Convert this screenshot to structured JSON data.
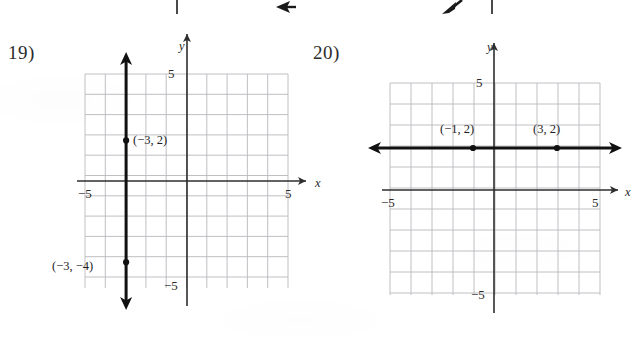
{
  "page": {
    "width": 635,
    "height": 337,
    "background": "#ffffff",
    "ink_color": "#1a1a1a",
    "grid_color": "#b9b9bd",
    "axis_color": "#2e2e2e"
  },
  "top_fragments": [
    {
      "name": "tick-fragment-left",
      "kind": "vertical-tick",
      "x": 176,
      "y": 0,
      "height": 14
    },
    {
      "name": "arrowhead-fragment-left",
      "kind": "arrowhead-left",
      "x": 274,
      "y": 0
    },
    {
      "name": "arrowhead-fragment-right",
      "kind": "arrowhead-diagonal",
      "x": 440,
      "y": 0
    },
    {
      "name": "tick-fragment-right",
      "kind": "vertical-tick",
      "x": 491,
      "y": 0,
      "height": 14
    }
  ],
  "problems": [
    {
      "number": "19)",
      "number_pos": {
        "x": 8,
        "y": 42
      },
      "graph": {
        "origin": {
          "x": 187,
          "y": 181
        },
        "cell": 20.3,
        "grid_box": {
          "left": 85,
          "top": 74,
          "right": 288,
          "bottom": 288
        },
        "x_axis_label": "x",
        "y_axis_label": "y",
        "x_axis_label_pos": {
          "x": 315,
          "y": 176
        },
        "y_axis_label_pos": {
          "x": 179,
          "y": 39
        },
        "ticks": [
          {
            "text": "5",
            "axis": "y",
            "value": 5,
            "pos": {
              "x": 168,
              "y": 66
            }
          },
          {
            "text": "−5",
            "axis": "y",
            "value": -5,
            "pos": {
              "x": 164,
              "y": 278
            }
          },
          {
            "text": "5",
            "axis": "x",
            "value": 5,
            "pos": {
              "x": 285,
              "y": 186
            }
          },
          {
            "text": "−5",
            "axis": "x",
            "value": -5,
            "pos": {
              "x": 78,
              "y": 186
            }
          }
        ],
        "line": {
          "type": "vertical",
          "equation_x": -3,
          "description": "vertical line through x = -3"
        },
        "points": [
          {
            "label": "(−3, 2)",
            "x": -3,
            "y": 2,
            "label_pos": {
              "x": 133,
              "y": 133
            }
          },
          {
            "label": "(−3, −4)",
            "x": -3,
            "y": -4,
            "label_pos": {
              "x": 52,
              "y": 259
            }
          }
        ]
      }
    },
    {
      "number": "20)",
      "number_pos": {
        "x": 313,
        "y": 42
      },
      "graph": {
        "origin": {
          "x": 494,
          "y": 190
        },
        "cell": 21.0,
        "grid_box": {
          "left": 390,
          "top": 83,
          "right": 600,
          "bottom": 295
        },
        "x_axis_label": "x",
        "y_axis_label": "y",
        "x_axis_label_pos": {
          "x": 625,
          "y": 185
        },
        "y_axis_label_pos": {
          "x": 487,
          "y": 40
        },
        "ticks": [
          {
            "text": "5",
            "axis": "y",
            "value": 5,
            "pos": {
              "x": 476,
              "y": 75
            }
          },
          {
            "text": "−5",
            "axis": "y",
            "value": -5,
            "pos": {
              "x": 471,
              "y": 287
            }
          },
          {
            "text": "5",
            "axis": "x",
            "value": 5,
            "pos": {
              "x": 592,
              "y": 195
            }
          },
          {
            "text": "−5",
            "axis": "x",
            "value": -5,
            "pos": {
              "x": 381,
              "y": 195
            }
          }
        ],
        "line": {
          "type": "horizontal",
          "equation_y": 2,
          "description": "horizontal line through y = 2"
        },
        "points": [
          {
            "label": "(−1, 2)",
            "x": -1,
            "y": 2,
            "label_pos": {
              "x": 440,
              "y": 122
            }
          },
          {
            "label": "(3, 2)",
            "x": 3,
            "y": 2,
            "label_pos": {
              "x": 533,
              "y": 122
            }
          }
        ]
      }
    }
  ],
  "chart_data": [
    {
      "type": "line",
      "title": "19)",
      "xlabel": "x",
      "ylabel": "y",
      "xlim": [
        -5,
        5
      ],
      "ylim": [
        -5,
        5
      ],
      "grid": true,
      "series": [
        {
          "name": "x = -3",
          "orientation": "vertical",
          "constant": -3,
          "arrows": "both",
          "points": [
            {
              "x": -3,
              "y": 2,
              "label": "(−3, 2)"
            },
            {
              "x": -3,
              "y": -4,
              "label": "(−3, −4)"
            }
          ]
        }
      ],
      "tick_labels": {
        "x": [
          "−5",
          "5"
        ],
        "y": [
          "5",
          "−5"
        ]
      }
    },
    {
      "type": "line",
      "title": "20)",
      "xlabel": "x",
      "ylabel": "y",
      "xlim": [
        -5,
        5
      ],
      "ylim": [
        -5,
        5
      ],
      "grid": true,
      "series": [
        {
          "name": "y = 2",
          "orientation": "horizontal",
          "constant": 2,
          "arrows": "both",
          "points": [
            {
              "x": -1,
              "y": 2,
              "label": "(−1, 2)"
            },
            {
              "x": 3,
              "y": 2,
              "label": "(3, 2)"
            }
          ]
        }
      ],
      "tick_labels": {
        "x": [
          "−5",
          "5"
        ],
        "y": [
          "5",
          "−5"
        ]
      }
    }
  ]
}
